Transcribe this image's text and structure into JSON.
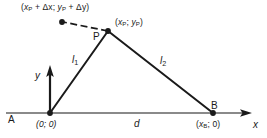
{
  "figure": {
    "type": "geometry-diagram",
    "background_color": "#ffffff",
    "stroke_color": "#1a1a1a",
    "axis_color": "#808080",
    "labels": {
      "displaced_point_coord": {
        "open": "(",
        "x_sym": "x",
        "x_sub": "P",
        "plus": "+",
        "dx": "Δx",
        "sep": "; ",
        "y_sym": "y",
        "y_sub": "P",
        "plus2": "+",
        "dy": "Δy",
        "close": ")",
        "full": "(xP + Δx; yP + Δy)"
      },
      "p_coord": {
        "open": "(",
        "x_sym": "x",
        "x_sub": "P",
        "sep": "; ",
        "y_sym": "y",
        "y_sub": "P",
        "close": ")",
        "full": "(xP; yP)"
      },
      "origin_coord": {
        "full": "(0; 0)"
      },
      "b_coord": {
        "open": "(",
        "x_sym": "x",
        "x_sub": "B",
        "sep": "; 0",
        "close": ")",
        "full": "(xB; 0)"
      },
      "point_p": "P",
      "point_a": "A",
      "point_b": "B",
      "segment_1": {
        "sym": "l",
        "sub": "1"
      },
      "segment_2": {
        "sym": "l",
        "sub": "2"
      },
      "axis_x": "x",
      "axis_y": "y",
      "distance_d": "d"
    },
    "geometry": {
      "origin": {
        "x": 50,
        "y": 113
      },
      "point_p": {
        "x": 108,
        "y": 31
      },
      "point_b": {
        "x": 213,
        "y": 113
      },
      "displaced_point": {
        "x": 62,
        "y": 22
      },
      "x_axis": {
        "x1": 6,
        "y1": 113,
        "x2": 252,
        "y2": 113
      },
      "y_axis": {
        "x1": 50,
        "y1": 113,
        "x2": 50,
        "y2": 66
      }
    }
  }
}
